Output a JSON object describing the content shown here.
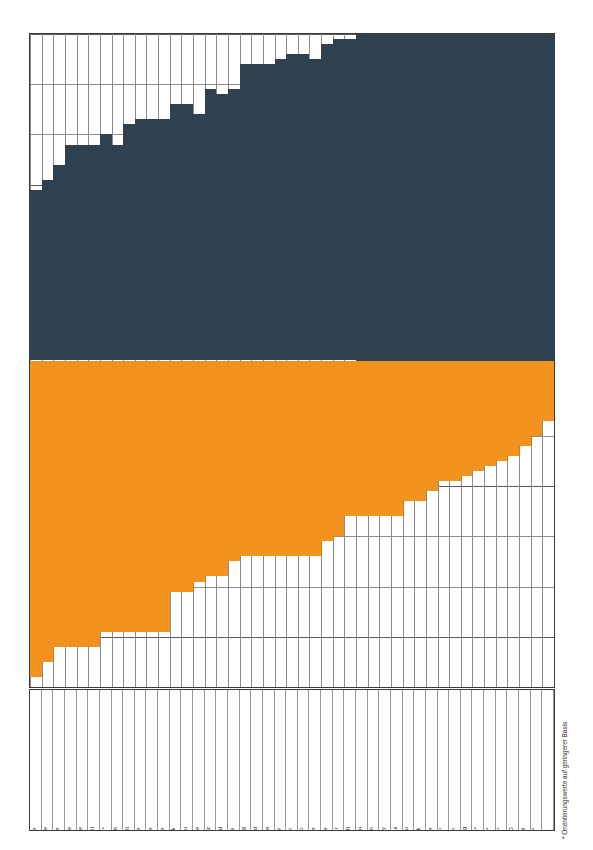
{
  "chart_data": {
    "type": "bar",
    "title": "",
    "subtitle": "",
    "xlabel": "",
    "ylabel": "",
    "grid": true,
    "legend_position": "none",
    "orientation": "vertical",
    "stacked": true,
    "baseline_note": "Upper (navy) segment grows upward from a fixed mid-line; lower (orange) segment grows downward from the same mid-line.",
    "colors": {
      "segment_top": "#2e4151",
      "segment_bottom": "#f2921f",
      "grid": "#585858",
      "frame": "#3a3a3a",
      "background": "#ffffff"
    },
    "axis": {
      "y_gridline_count": 13,
      "y_gridline_spacing_units": 1,
      "y_top": 13,
      "y_bottom": 0,
      "baseline_gridline_index": 6.5
    },
    "categories": [
      "Das Neue Blatt",
      "Das Neue",
      "Praline",
      "Freizeit Revue",
      "Die Aktuelle",
      "Ein Herz für Tiere",
      "Neue Post",
      "Rallye Racing*",
      "Das Goldene Blatt",
      "Neue Welt",
      "Das Beste",
      "7 Tage",
      "Neue Revue",
      "Quick",
      "Echo der Frau",
      "Bunte",
      "Frau mit Herz",
      "Wochenend",
      "Auf einen Blick",
      "Bild am Sonntag",
      "Weltbild",
      "Fernsehwoche",
      "Hobby",
      "Stern",
      "Tempo",
      "Bildwoche",
      "Wirtschaftswoche",
      "Funk Uhr",
      "Bild der Wissenschaft",
      "Die Zwei",
      "TV Hören + Sehen",
      "Playboy",
      "Lui",
      "Hörzu",
      "Bild + Funk",
      "Penthouse",
      "Pop Rocky*",
      "P.M. Magazin",
      "Gong",
      "Sport Illustrierte*",
      "Popcorn*",
      "Bravo*",
      "GEO",
      "Der Spiegel",
      "Musik Express/Sounds*"
    ],
    "series": [
      {
        "name": "upper-segment",
        "color": "#2e4151",
        "values": [
          3.4,
          3.6,
          3.9,
          4.3,
          4.3,
          4.3,
          4.5,
          4.3,
          4.7,
          4.8,
          4.8,
          4.8,
          5.1,
          5.1,
          4.9,
          5.4,
          5.3,
          5.4,
          5.9,
          5.9,
          5.9,
          6.0,
          6.1,
          6.1,
          6.0,
          6.3,
          6.4,
          6.4,
          6.6,
          6.8,
          6.8,
          6.9,
          7.0,
          7.1,
          7.2,
          7.3,
          7.5,
          7.6,
          7.9,
          8.1,
          8.3,
          8.6,
          8.9,
          9.2,
          10.4
        ]
      },
      {
        "name": "lower-segment",
        "color": "#f2921f",
        "values": [
          6.3,
          6.0,
          5.7,
          5.7,
          5.7,
          5.7,
          5.4,
          5.4,
          5.4,
          5.4,
          5.4,
          5.4,
          4.6,
          4.6,
          4.4,
          4.3,
          4.3,
          4.0,
          3.9,
          3.9,
          3.9,
          3.9,
          3.9,
          3.9,
          3.9,
          3.6,
          3.5,
          3.1,
          3.1,
          3.1,
          3.1,
          3.1,
          2.8,
          2.8,
          2.6,
          2.4,
          2.4,
          2.3,
          2.2,
          2.1,
          2.0,
          1.9,
          1.7,
          1.5,
          1.2
        ]
      }
    ],
    "footnote": "* Orientierungswerte auf geringerer Basis"
  }
}
